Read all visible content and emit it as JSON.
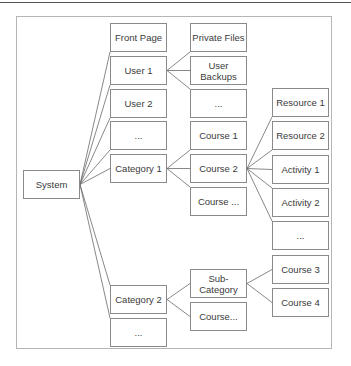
{
  "diagram": {
    "nodes": [
      {
        "id": "system",
        "label": "System"
      },
      {
        "id": "front-page",
        "label": "Front Page"
      },
      {
        "id": "user-1",
        "label": "User 1"
      },
      {
        "id": "user-2",
        "label": "User 2"
      },
      {
        "id": "users-more",
        "label": "..."
      },
      {
        "id": "category-1",
        "label": "Category 1"
      },
      {
        "id": "category-2",
        "label": "Category 2"
      },
      {
        "id": "categories-more",
        "label": "..."
      },
      {
        "id": "private-files",
        "label": "Private Files"
      },
      {
        "id": "user-backups",
        "label": "User\nBackups"
      },
      {
        "id": "user-items-more",
        "label": "..."
      },
      {
        "id": "course-1",
        "label": "Course 1"
      },
      {
        "id": "course-2",
        "label": "Course 2"
      },
      {
        "id": "course-more-1",
        "label": "Course ..."
      },
      {
        "id": "sub-category",
        "label": "Sub-\nCategory"
      },
      {
        "id": "course-more-2",
        "label": "Course..."
      },
      {
        "id": "resource-1",
        "label": "Resource 1"
      },
      {
        "id": "resource-2",
        "label": "Resource 2"
      },
      {
        "id": "activity-1",
        "label": "Activity 1"
      },
      {
        "id": "activity-2",
        "label": "Activity 2"
      },
      {
        "id": "activities-more",
        "label": "..."
      },
      {
        "id": "course-3",
        "label": "Course 3"
      },
      {
        "id": "course-4",
        "label": "Course 4"
      }
    ],
    "edges": [
      [
        "system",
        "front-page"
      ],
      [
        "system",
        "user-1"
      ],
      [
        "system",
        "user-2"
      ],
      [
        "system",
        "users-more"
      ],
      [
        "system",
        "category-1"
      ],
      [
        "system",
        "category-2"
      ],
      [
        "system",
        "categories-more"
      ],
      [
        "user-1",
        "private-files"
      ],
      [
        "user-1",
        "user-backups"
      ],
      [
        "user-1",
        "user-items-more"
      ],
      [
        "category-1",
        "course-1"
      ],
      [
        "category-1",
        "course-2"
      ],
      [
        "category-1",
        "course-more-1"
      ],
      [
        "course-2",
        "resource-1"
      ],
      [
        "course-2",
        "resource-2"
      ],
      [
        "course-2",
        "activity-1"
      ],
      [
        "course-2",
        "activity-2"
      ],
      [
        "course-2",
        "activities-more"
      ],
      [
        "category-2",
        "sub-category"
      ],
      [
        "category-2",
        "course-more-2"
      ],
      [
        "sub-category",
        "course-3"
      ],
      [
        "sub-category",
        "course-4"
      ]
    ]
  }
}
